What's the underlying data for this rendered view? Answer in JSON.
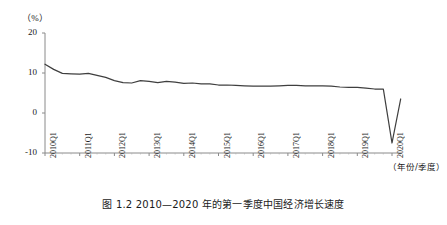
{
  "figure": {
    "caption": "图 1.2  2010—2020 年的第一季度中国经济增长速度",
    "unit_label": "（%）",
    "xaxis_title": "（年份/季度）"
  },
  "chart_data": {
    "type": "line",
    "title": "图 1.2  2010—2020 年的第一季度中国经济增长速度",
    "xlabel": "（年份/季度）",
    "ylabel": "（%）",
    "ylim": [
      -10,
      20
    ],
    "yticks": [
      20,
      10,
      0,
      -10
    ],
    "ytick_labels": [
      "20",
      "10",
      "0",
      "-10"
    ],
    "xtick_labels": [
      "2010Q1",
      "2011Q1",
      "2012Q1",
      "2013Q1",
      "2014Q1",
      "2015Q1",
      "2016Q1",
      "2017Q1",
      "2018Q1",
      "2019Q1",
      "2020Q1"
    ],
    "grid": false,
    "legend": null,
    "line_color": "#3f3f3f",
    "series": [
      {
        "name": "中国经济增长速度",
        "x": [
          "2010Q1",
          "2010Q2",
          "2010Q3",
          "2010Q4",
          "2011Q1",
          "2011Q2",
          "2011Q3",
          "2011Q4",
          "2012Q1",
          "2012Q2",
          "2012Q3",
          "2012Q4",
          "2013Q1",
          "2013Q2",
          "2013Q3",
          "2013Q4",
          "2014Q1",
          "2014Q2",
          "2014Q3",
          "2014Q4",
          "2015Q1",
          "2015Q2",
          "2015Q3",
          "2015Q4",
          "2016Q1",
          "2016Q2",
          "2016Q3",
          "2016Q4",
          "2017Q1",
          "2017Q2",
          "2017Q3",
          "2017Q4",
          "2018Q1",
          "2018Q2",
          "2018Q3",
          "2018Q4",
          "2019Q1",
          "2019Q2",
          "2019Q3",
          "2019Q4",
          "2020Q1",
          "2020Q2"
        ],
        "values": [
          12.2,
          10.9,
          9.9,
          9.8,
          9.7,
          9.9,
          9.4,
          8.9,
          8.1,
          7.6,
          7.5,
          8.1,
          7.9,
          7.6,
          7.9,
          7.7,
          7.4,
          7.5,
          7.3,
          7.3,
          7.0,
          7.0,
          6.9,
          6.8,
          6.7,
          6.7,
          6.7,
          6.8,
          6.9,
          6.9,
          6.8,
          6.8,
          6.8,
          6.7,
          6.5,
          6.4,
          6.4,
          6.2,
          6.0,
          6.0,
          -7.5,
          3.5
        ]
      }
    ]
  },
  "axes": {
    "yticks": [
      {
        "label": "20",
        "value": 20
      },
      {
        "label": "10",
        "value": 10
      },
      {
        "label": "0",
        "value": 0
      },
      {
        "label": "-10",
        "value": -10
      }
    ],
    "xticks": [
      {
        "label": "2010Q1"
      },
      {
        "label": "2011Q1"
      },
      {
        "label": "2012Q1"
      },
      {
        "label": "2013Q1"
      },
      {
        "label": "2014Q1"
      },
      {
        "label": "2015Q1"
      },
      {
        "label": "2016Q1"
      },
      {
        "label": "2017Q1"
      },
      {
        "label": "2018Q1"
      },
      {
        "label": "2019Q1"
      },
      {
        "label": "2020Q1"
      }
    ]
  },
  "colors": {
    "line": "#3f3f3f",
    "axis": "#8a8a8a",
    "text": "#1a1a1a",
    "background": "#ffffff"
  }
}
